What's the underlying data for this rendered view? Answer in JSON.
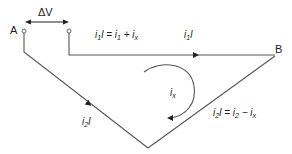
{
  "diagram": {
    "type": "current-loop",
    "nodes": {
      "A": {
        "label": "A"
      },
      "B": {
        "label": "B"
      }
    },
    "voltage": {
      "label": "ΔV"
    },
    "labels": {
      "top_left_current": {
        "i": "i",
        "sub": "1",
        "l": "l",
        "rhs": " = i",
        "rhs_sub": "1",
        "plus": " + i",
        "plus_sub": "x"
      },
      "top_right_current": {
        "i": "i",
        "sub": "1",
        "l": "l"
      },
      "loop_current": {
        "i": "i",
        "sub": "x"
      },
      "bottom_left_current": {
        "i": "i",
        "sub": "2",
        "l": "l"
      },
      "bottom_right_current": {
        "i": "i",
        "sub": "2",
        "l": "l",
        "rhs": " = i",
        "rhs_sub": "2",
        "minus": " − i",
        "minus_sub": "x"
      }
    },
    "colors": {
      "wire": "#555555",
      "text": "#222222",
      "background": "#ffffff"
    }
  }
}
